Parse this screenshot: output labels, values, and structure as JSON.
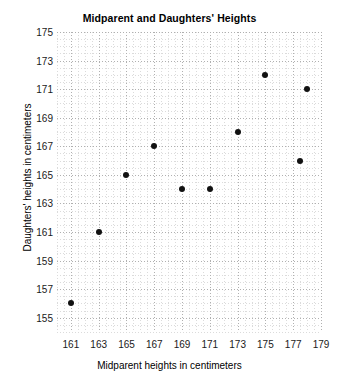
{
  "chart_data": {
    "type": "scatter",
    "title": "Midparent and Daughters' Heights",
    "xlabel": "Midparent heights in centimeters",
    "ylabel": "Daughters' heights in centimeters",
    "xlim": [
      160,
      179
    ],
    "ylim": [
      154,
      175
    ],
    "xticks": [
      161,
      163,
      165,
      167,
      169,
      171,
      173,
      175,
      177,
      179
    ],
    "yticks": [
      155,
      157,
      159,
      161,
      163,
      165,
      167,
      169,
      171,
      173,
      175
    ],
    "grid": true,
    "grid_style": "dotted",
    "legend": null,
    "marker": "filled-circle",
    "marker_color": "#111111",
    "points": [
      {
        "x": 161,
        "y": 156
      },
      {
        "x": 163,
        "y": 161
      },
      {
        "x": 165,
        "y": 165
      },
      {
        "x": 167,
        "y": 167
      },
      {
        "x": 169,
        "y": 164
      },
      {
        "x": 171,
        "y": 164
      },
      {
        "x": 173,
        "y": 168
      },
      {
        "x": 175,
        "y": 172
      },
      {
        "x": 177.5,
        "y": 166
      },
      {
        "x": 178,
        "y": 171
      }
    ]
  }
}
